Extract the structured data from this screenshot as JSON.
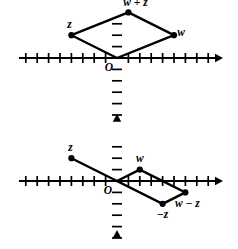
{
  "figure": {
    "background_color": "#ffffff",
    "stroke_color": "#000000",
    "panels": [
      {
        "id": "top",
        "caption": "Parallelogram formed by vectors w and z with resultant w + z",
        "origin_label": "O",
        "axis": {
          "x_min": -9,
          "x_max": 9,
          "y_min": -5,
          "y_max": 5,
          "tick_spacing": 1,
          "ticks": true,
          "arrows": [
            "x-right",
            "y-up"
          ]
        },
        "points": [
          {
            "name": "origin",
            "label": "O",
            "x": 0,
            "y": 0,
            "dot": false,
            "label_dx": -8,
            "label_dy": 13
          },
          {
            "name": "z",
            "label": "z",
            "x": -4,
            "y": 2,
            "dot": true,
            "label_dx": -2,
            "label_dy": -7
          },
          {
            "name": "w-plus-z",
            "label": "w + z",
            "x": 1,
            "y": 4,
            "dot": true,
            "label_dx": 7,
            "label_dy": -6
          },
          {
            "name": "w",
            "label": "w",
            "x": 5,
            "y": 2,
            "dot": true,
            "label_dx": 7,
            "label_dy": 1
          }
        ],
        "polygon": [
          "origin",
          "z",
          "w-plus-z",
          "w"
        ]
      },
      {
        "id": "bottom",
        "caption": "Parallelogram formed by vectors w and -z with resultant w - z",
        "origin_label": "O",
        "axis": {
          "x_min": -9,
          "x_max": 9,
          "y_min": -4,
          "y_max": 4,
          "tick_spacing": 1,
          "ticks": true,
          "arrows": [
            "x-right",
            "y-up"
          ]
        },
        "points": [
          {
            "name": "origin",
            "label": "O",
            "x": 0,
            "y": 0,
            "dot": false,
            "label_dx": -9,
            "label_dy": 13
          },
          {
            "name": "z",
            "label": "z",
            "x": -4,
            "y": 2,
            "dot": true,
            "label_dx": -1,
            "label_dy": -7
          },
          {
            "name": "w",
            "label": "w",
            "x": 2,
            "y": 1,
            "dot": true,
            "label_dx": 0,
            "label_dy": -8
          },
          {
            "name": "w-minus-z",
            "label": "w − z",
            "x": 6,
            "y": -1,
            "dot": true,
            "label_dx": 2,
            "label_dy": 15
          },
          {
            "name": "minus-z",
            "label": "−z",
            "x": 4,
            "y": -2,
            "dot": true,
            "label_dx": 0,
            "label_dy": 14
          }
        ],
        "polygon": [
          "origin",
          "w",
          "w-minus-z",
          "minus-z"
        ],
        "extra_segments": [
          [
            "z",
            "origin"
          ]
        ]
      }
    ]
  },
  "chart_data": {
    "type": "scatter",
    "title": "",
    "xlabel": "",
    "ylabel": "",
    "panels": [
      {
        "name": "vector-addition",
        "xlim": [
          -9,
          9
        ],
        "ylim": [
          -5,
          5
        ],
        "grid": false,
        "legend": "none",
        "labels": [
          "z",
          "w + z",
          "w",
          "O"
        ],
        "x": [
          -4,
          1,
          5,
          0
        ],
        "y": [
          2,
          4,
          2,
          0
        ],
        "edges": [
          [
            0,
            0
          ],
          [
            -4,
            2
          ],
          [
            1,
            4
          ],
          [
            5,
            2
          ],
          [
            0,
            0
          ]
        ]
      },
      {
        "name": "vector-subtraction",
        "xlim": [
          -9,
          9
        ],
        "ylim": [
          -4,
          4
        ],
        "grid": false,
        "legend": "none",
        "labels": [
          "z",
          "w",
          "w − z",
          "−z",
          "O"
        ],
        "x": [
          -4,
          2,
          6,
          4,
          0
        ],
        "y": [
          2,
          1,
          -1,
          -2,
          0
        ],
        "edges": [
          [
            0,
            0
          ],
          [
            2,
            1
          ],
          [
            6,
            -1
          ],
          [
            4,
            -2
          ],
          [
            0,
            0
          ]
        ],
        "extra_edges": [
          [
            -4,
            2
          ],
          [
            0,
            0
          ]
        ]
      }
    ]
  }
}
